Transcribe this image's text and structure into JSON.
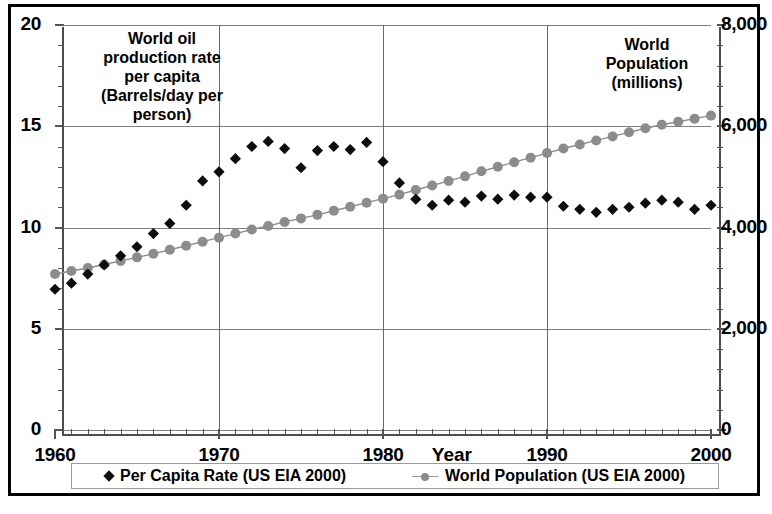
{
  "chart_data": {
    "type": "scatter",
    "title": "",
    "xlabel": "Year",
    "ylabel_left": "World oil production rate per capita (Barrels/day per person)",
    "ylabel_right": "World Population (millions)",
    "xlim": [
      1960,
      2000
    ],
    "ylim_left": [
      0,
      20
    ],
    "ylim_right": [
      0,
      8000
    ],
    "grid": true,
    "legend_position": "bottom",
    "x_ticks_major": [
      1960,
      1970,
      1980,
      1990,
      2000
    ],
    "x_tick_labels": [
      "1960",
      "1970",
      "1980",
      "1990",
      "2000"
    ],
    "y_ticks_left": [
      0,
      5,
      10,
      15,
      20
    ],
    "y_tick_labels_left": [
      "0",
      "5",
      "10",
      "15",
      "20"
    ],
    "y_ticks_right": [
      0,
      2000,
      4000,
      6000,
      8000
    ],
    "y_tick_labels_right": [
      "0",
      "2,000",
      "4,000",
      "6,000",
      "8,000"
    ],
    "x": [
      1960,
      1961,
      1962,
      1963,
      1964,
      1965,
      1966,
      1967,
      1968,
      1969,
      1970,
      1971,
      1972,
      1973,
      1974,
      1975,
      1976,
      1977,
      1978,
      1979,
      1980,
      1981,
      1982,
      1983,
      1984,
      1985,
      1986,
      1987,
      1988,
      1989,
      1990,
      1991,
      1992,
      1993,
      1994,
      1995,
      1996,
      1997,
      1998,
      1999,
      2000
    ],
    "series": [
      {
        "name": "Per Capita Rate (US EIA 2000)",
        "axis": "left",
        "unit": "Barrels/day per person",
        "marker": "diamond",
        "color": "#0d0d0d",
        "values": [
          6.95,
          7.25,
          7.7,
          8.15,
          8.6,
          9.05,
          9.7,
          10.2,
          11.1,
          12.3,
          12.75,
          13.4,
          14.0,
          14.25,
          13.9,
          12.95,
          13.8,
          14.0,
          13.85,
          14.2,
          13.25,
          12.2,
          11.4,
          11.1,
          11.35,
          11.25,
          11.55,
          11.4,
          11.6,
          11.5,
          11.5,
          11.05,
          10.9,
          10.75,
          10.9,
          11.0,
          11.2,
          11.35,
          11.25,
          10.9,
          11.1
        ]
      },
      {
        "name": "World Population (US EIA 2000)",
        "axis": "right",
        "unit": "millions",
        "marker": "circle-line",
        "color": "#8c8c8c",
        "values": [
          3080,
          3140,
          3200,
          3270,
          3340,
          3410,
          3480,
          3560,
          3640,
          3720,
          3800,
          3880,
          3960,
          4030,
          4110,
          4180,
          4250,
          4330,
          4410,
          4490,
          4570,
          4650,
          4740,
          4830,
          4920,
          5010,
          5110,
          5200,
          5290,
          5380,
          5470,
          5560,
          5640,
          5720,
          5800,
          5880,
          5960,
          6030,
          6090,
          6150,
          6210
        ]
      }
    ]
  },
  "annotations": {
    "left_note": "World oil production rate per capita (Barrels/day per person)",
    "left_note_lines": [
      "World oil",
      "production rate",
      "per capita",
      "(Barrels/day per",
      "person)"
    ],
    "right_note_lines": [
      "World",
      "Population",
      "(millions)"
    ]
  },
  "axis": {
    "x_title": "Year"
  },
  "legend": {
    "items": [
      {
        "label": "Per Capita Rate (US EIA 2000)",
        "marker": "diamond"
      },
      {
        "label": "World Population (US EIA 2000)",
        "marker": "circle-line"
      }
    ]
  },
  "colors": {
    "per_capita": "#0d0d0d",
    "population": "#8c8c8c",
    "grid": "#808080",
    "axis": "#4d4d4d",
    "frame": "#000000"
  }
}
